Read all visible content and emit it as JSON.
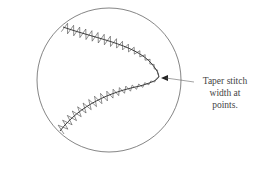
{
  "figure": {
    "callout": {
      "lines": [
        "Taper stitch",
        "width at",
        "points."
      ]
    },
    "colors": {
      "stroke": "#555555",
      "stitch": "#333333",
      "text": "#444444"
    }
  }
}
